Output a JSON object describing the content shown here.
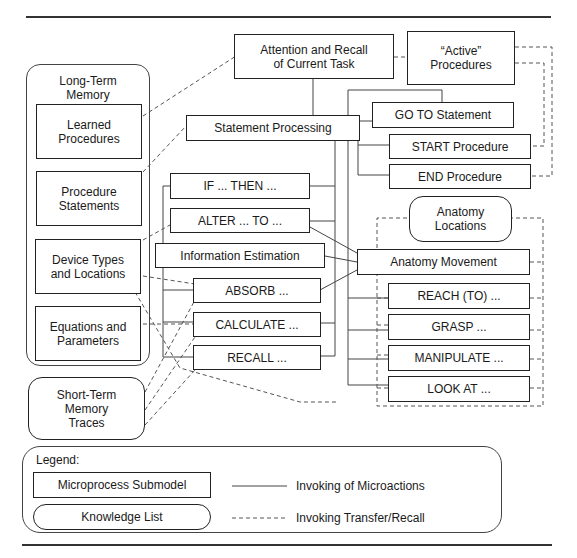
{
  "diagram": {
    "top_rule": true,
    "bottom_rule": true,
    "nodes": {
      "attention": "Attention and Recall\nof Current Task",
      "active_procedures": "“Active”\nProcedures",
      "statement_processing": "Statement Processing",
      "goto_statement": "GO TO Statement",
      "start_procedure": "START Procedure",
      "end_procedure": "END Procedure",
      "if_then": "IF ... THEN ...",
      "alter_to": "ALTER ... TO ...",
      "information_estimation": "Information Estimation",
      "absorb": "ABSORB ...",
      "calculate": "CALCULATE ...",
      "recall": "RECALL ...",
      "anatomy_locations": "Anatomy\nLocations",
      "anatomy_movement": "Anatomy Movement",
      "reach_to": "REACH (TO) ...",
      "grasp": "GRASP ...",
      "manipulate": "MANIPULATE ...",
      "look_at": "LOOK AT ..."
    },
    "long_term_memory": {
      "title": "Long-Term\nMemory",
      "items": [
        "Learned\nProcedures",
        "Procedure\nStatements",
        "Device Types\nand Locations",
        "Equations and\nParameters"
      ]
    },
    "short_term_memory": "Short-Term\nMemory\nTraces",
    "legend": {
      "title": "Legend:",
      "submodel_label": "Microprocess Submodel",
      "knowledge_label": "Knowledge List",
      "solid_line_label": "Invoking of Microactions",
      "dashed_line_label": "Invoking Transfer/Recall"
    },
    "colors": {
      "stroke": "#222222",
      "background": "#ffffff"
    }
  }
}
